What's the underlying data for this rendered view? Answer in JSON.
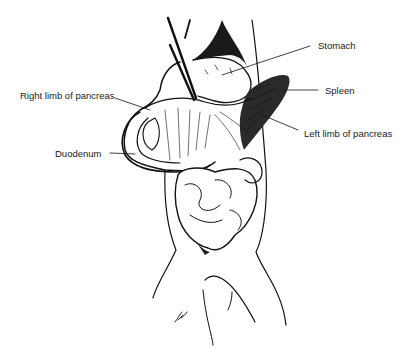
{
  "figure": {
    "type": "anatomical line illustration",
    "ink_color": "#111111",
    "background_color": "#ffffff",
    "labels": [
      {
        "id": "stomach",
        "text": "Stomach"
      },
      {
        "id": "spleen",
        "text": "Spleen"
      },
      {
        "id": "right-limb-pancreas",
        "text": "Right limb of pancreas"
      },
      {
        "id": "left-limb-pancreas",
        "text": "Left limb of pancreas"
      },
      {
        "id": "duodenum",
        "text": "Duodenum"
      }
    ]
  }
}
